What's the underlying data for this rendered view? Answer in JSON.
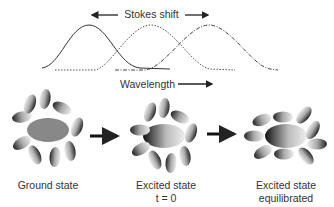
{
  "spectra": {
    "top_label": "Stokes shift",
    "axis_label": "Wavelength",
    "curves": [
      {
        "name": "absorption",
        "style": "solid",
        "peak_x": 89
      },
      {
        "name": "emission-initial",
        "style": "dotted",
        "peak_x": 151
      },
      {
        "name": "emission-equilibrated",
        "style": "dash-dot",
        "peak_x": 209
      }
    ]
  },
  "states": [
    {
      "label": "Ground state",
      "sublabel": ""
    },
    {
      "label": "Excited state",
      "sublabel": "t = 0"
    },
    {
      "label": "Excited state",
      "sublabel": "equilibrated"
    }
  ],
  "colors": {
    "text": "#333333",
    "line": "#222222",
    "arrow": "#111111"
  }
}
